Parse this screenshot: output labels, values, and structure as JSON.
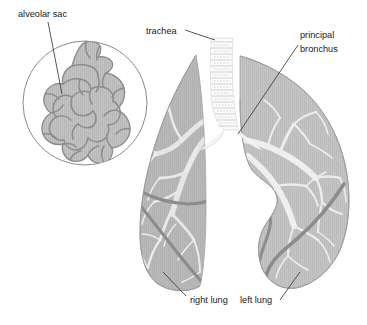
{
  "figure": {
    "type": "anatomical-illustration",
    "background_color": "#ffffff"
  },
  "labels": {
    "alveolar_sac": "alveolar sac",
    "trachea": "trachea",
    "principal_bronchus_line1": "principal",
    "principal_bronchus_line2": "bronchus",
    "right_lung": "right lung",
    "left_lung": "left lung"
  },
  "colors": {
    "lung_fill": "#b9b9b9",
    "lung_fill_light": "#c9c9c9",
    "lung_edge": "#9a9a9a",
    "bronchial_tree": "#e8e8e8",
    "fissure": "#8a8a8a",
    "trachea_fill": "#fbfbfb",
    "trachea_ring": "#d8d8d8",
    "alveoli_fill": "#c2c2c2",
    "alveoli_outline": "#8d8d8d",
    "magnifier_stroke": "#8a8a8a",
    "leader_line": "#3a3a3a",
    "text": "#1a1a1a"
  },
  "parts": [
    {
      "name": "alveolar-sac",
      "label": "alveolar sac",
      "description": "magnified cluster of alveoli inside circular inset"
    },
    {
      "name": "trachea",
      "label": "trachea",
      "description": "vertical windpipe with cartilage rings"
    },
    {
      "name": "principal-bronchus",
      "label": "principal bronchus",
      "description": "main airway entering the left lung hilum"
    },
    {
      "name": "right-lung",
      "label": "right lung",
      "description": "lung on viewer left, three lobes, two fissures"
    },
    {
      "name": "left-lung",
      "label": "left lung",
      "description": "lung on viewer right, two lobes, cardiac notch"
    }
  ]
}
